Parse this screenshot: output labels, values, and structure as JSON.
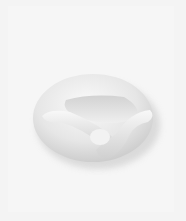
{
  "image": {
    "subject": "white pretzel-shaped sculpture",
    "background_color": "#f4f4f4",
    "object_color": "#ececec",
    "shadow_color": "#c4c4c4"
  }
}
